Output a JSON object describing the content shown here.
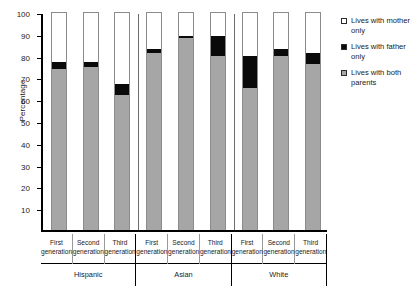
{
  "chart": {
    "type": "bar",
    "ylabel": "Percentage"
  },
  "legend": {
    "items": [
      {
        "label": "Lives with mother only",
        "color": "#ffffff",
        "name": "mother-only"
      },
      {
        "label": "Lives with father only",
        "color": "#0a0a0a",
        "name": "father-only"
      },
      {
        "label": "Lives with both parents",
        "color": "#a6a6a6",
        "name": "both-parents"
      }
    ]
  },
  "chart_data": {
    "type": "bar",
    "title": "",
    "subtitle": "",
    "xlabel": "",
    "ylabel": "Percentage",
    "ylim": [
      0,
      100
    ],
    "yticks": [
      10,
      20,
      30,
      40,
      50,
      60,
      70,
      80,
      90,
      100
    ],
    "ytick_labels": [
      "10",
      "20",
      "30",
      "40",
      "50",
      "60",
      "70",
      "80",
      "90",
      "100"
    ],
    "grid": false,
    "stacked": true,
    "legend_position": "right",
    "groups": [
      "Hispanic",
      "Asian",
      "White"
    ],
    "categories": [
      "First generation",
      "Second generation",
      "Third generation",
      "First generation",
      "Second generation",
      "Third generation",
      "First generation",
      "Second generation",
      "Third generation"
    ],
    "series": [
      {
        "name": "Lives with both parents",
        "color": "#a6a6a6",
        "values": [
          74,
          75,
          62,
          81,
          88,
          80,
          65,
          80,
          76
        ]
      },
      {
        "name": "Lives with father only",
        "color": "#0a0a0a",
        "values": [
          3,
          2,
          5,
          2,
          1,
          9,
          15,
          3,
          5
        ]
      },
      {
        "name": "Lives with mother only",
        "color": "#ffffff",
        "values": [
          23,
          23,
          33,
          17,
          11,
          11,
          20,
          17,
          19
        ]
      }
    ],
    "cumulative_tops": {
      "both_parents": [
        74,
        75,
        62,
        81,
        88,
        80,
        65,
        80,
        76
      ],
      "plus_father_only": [
        77,
        77,
        67,
        83,
        89,
        89,
        80,
        83,
        81
      ]
    }
  },
  "xaxis": {
    "cells": [
      {
        "line1": "First",
        "line2": "generation",
        "group": "Hispanic"
      },
      {
        "line1": "Second",
        "line2": "generation",
        "group": "Hispanic"
      },
      {
        "line1": "Third",
        "line2": "generation",
        "group": "Hispanic"
      },
      {
        "line1": "First",
        "line2": "generation",
        "group": "Asian"
      },
      {
        "line1": "Second",
        "line2": "generation",
        "group": "Asian"
      },
      {
        "line1": "Third",
        "line2": "generation",
        "group": "Asian"
      },
      {
        "line1": "First",
        "line2": "generation",
        "group": "White"
      },
      {
        "line1": "Second",
        "line2": "generation",
        "group": "White"
      },
      {
        "line1": "Third",
        "line2": "generation",
        "group": "White"
      }
    ],
    "groups": [
      {
        "label": "Hispanic"
      },
      {
        "label": "Asian"
      },
      {
        "label": "White"
      }
    ]
  }
}
